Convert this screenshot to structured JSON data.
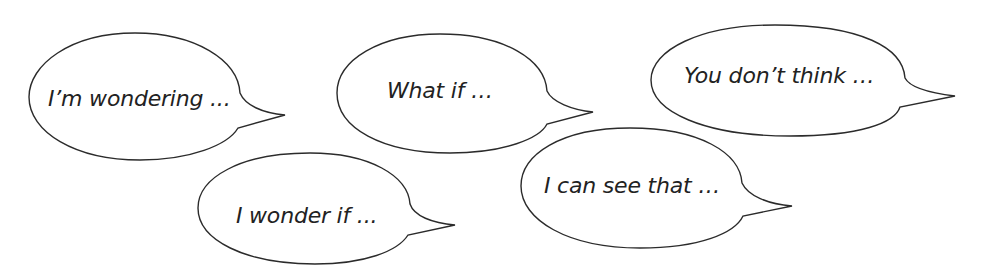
{
  "colors": {
    "background": "#ffffff",
    "outline": "#2b2b2b",
    "text": "#222222"
  },
  "bubbles": [
    {
      "id": "im-wondering",
      "text": "I’m wondering ..."
    },
    {
      "id": "what-if",
      "text": "What if …"
    },
    {
      "id": "you-dont-think",
      "text": "You don’t think …"
    },
    {
      "id": "i-wonder-if",
      "text": "I wonder if ..."
    },
    {
      "id": "i-can-see-that",
      "text": "I can see that …"
    }
  ]
}
